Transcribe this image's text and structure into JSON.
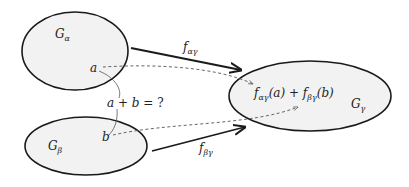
{
  "diagram": {
    "sets": [
      {
        "id": "alpha",
        "base": "G",
        "subscript": "α",
        "center": [
          75,
          51
        ],
        "rx": 53,
        "ry": 39
      },
      {
        "id": "beta",
        "base": "G",
        "subscript": "β",
        "center": [
          86,
          146
        ],
        "rx": 61,
        "ry": 29
      },
      {
        "id": "gamma",
        "base": "G",
        "subscript": "γ",
        "center": [
          310,
          96
        ],
        "rx": 81,
        "ry": 35
      }
    ],
    "elements": {
      "a": "a",
      "b": "b"
    },
    "question": {
      "a": "a",
      "plus": " + ",
      "b": "b",
      "eq": " = ?"
    },
    "maps": {
      "top": {
        "base": "f",
        "subscript": "αγ"
      },
      "bottom": {
        "base": "f",
        "subscript": "βγ"
      }
    },
    "result": {
      "f1": "f",
      "f1_sub": "αγ",
      "f1_arg": "(a)",
      "plus": " + ",
      "f2": "f",
      "f2_sub": "βγ",
      "f2_arg": "(b)"
    },
    "colors": {
      "ellipse_fill": "#f2f2f2",
      "stroke": "#1a1a1a",
      "dashed": "#555555"
    }
  }
}
